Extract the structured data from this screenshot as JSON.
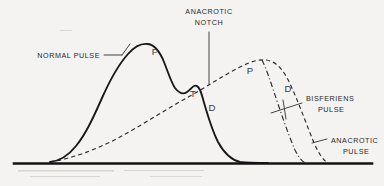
{
  "figure": {
    "title_visible": false,
    "background_color": "#f4f3f1",
    "ink_color": "#17171a",
    "annotations": {
      "anacrotic_notch": "ANACROTIC\nNOTCH",
      "anacrotic_notch_line1": "ANACROTIC",
      "anacrotic_notch_line2": "NOTCH",
      "normal_pulse": "NORMAL PULSE",
      "bisferiens_pulse_line1": "BISFERIENS",
      "bisferiens_pulse_line2": "PULSE",
      "anacrotic_pulse_line1": "ANACROTIC",
      "anacrotic_pulse_line2": "PULSE"
    },
    "wave_markers": {
      "normal_percussion": "P",
      "normal_tidal": "T",
      "normal_dicrotic": "D",
      "abnormal_percussion": "P",
      "abnormal_dicrotic": "D"
    },
    "curves": [
      {
        "name": "normal-pulse",
        "style": "solid",
        "label": "NORMAL PULSE",
        "markers": [
          "P",
          "T",
          "D"
        ]
      },
      {
        "name": "anacrotic-pulse",
        "style": "dashed",
        "label": "ANACROTIC PULSE",
        "markers": [
          "P",
          "D"
        ]
      },
      {
        "name": "bisferiens-pulse",
        "style": "dash-dot",
        "label": "BISFERIENS PULSE",
        "markers": []
      }
    ],
    "baseline": {
      "name": "baseline-axis",
      "visible": true
    }
  }
}
